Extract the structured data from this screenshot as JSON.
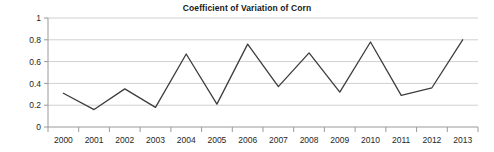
{
  "chart_data": {
    "type": "line",
    "title": "Coefficient of Variation of Corn",
    "xlabel": "",
    "ylabel": "",
    "categories": [
      "2000",
      "2001",
      "2002",
      "2003",
      "2004",
      "2005",
      "2006",
      "2007",
      "2008",
      "2009",
      "2010",
      "2011",
      "2012",
      "2013"
    ],
    "values": [
      0.31,
      0.16,
      0.35,
      0.18,
      0.67,
      0.21,
      0.76,
      0.37,
      0.68,
      0.32,
      0.78,
      0.29,
      0.36,
      0.8
    ],
    "series": [
      {
        "name": "Coefficient of Variation of Corn",
        "values": [
          0.31,
          0.16,
          0.35,
          0.18,
          0.67,
          0.21,
          0.76,
          0.37,
          0.68,
          0.32,
          0.78,
          0.29,
          0.36,
          0.8
        ]
      }
    ],
    "ylim": [
      0,
      1
    ],
    "ytick_labels": [
      "1",
      "0.8",
      "0.6",
      "0.4",
      "0.2",
      "0"
    ],
    "ytick_values": [
      1,
      0.8,
      0.6,
      0.4,
      0.2,
      0
    ],
    "grid": true,
    "legend": "none",
    "line_color": "#3d3d3d",
    "grid_color": "#d0d0d0",
    "axis_color": "#9a9a9a",
    "background_color": "#ffffff",
    "text_color": "#262626"
  },
  "axes": {
    "y_labels": {
      "t0": "1",
      "t1": "0.8",
      "t2": "0.6",
      "t3": "0.4",
      "t4": "0.2",
      "t5": "0"
    },
    "x_labels": {
      "c0": "2000",
      "c1": "2001",
      "c2": "2002",
      "c3": "2003",
      "c4": "2004",
      "c5": "2005",
      "c6": "2006",
      "c7": "2007",
      "c8": "2008",
      "c9": "2009",
      "c10": "2010",
      "c11": "2011",
      "c12": "2012",
      "c13": "2013"
    }
  }
}
